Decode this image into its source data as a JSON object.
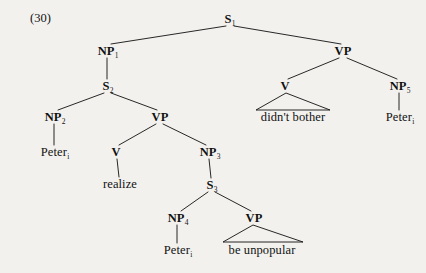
{
  "figure": {
    "example_number": "(30)",
    "type": "syntax-tree",
    "ink_color": "#111111",
    "background_color": "#f3f1ee"
  },
  "nodes": [
    {
      "id": "s1",
      "label": "S",
      "sub": "1",
      "x": 230,
      "y": 19,
      "kind": "nonterminal"
    },
    {
      "id": "np1",
      "label": "NP",
      "sub": "1",
      "x": 108,
      "y": 51,
      "kind": "nonterminal"
    },
    {
      "id": "vp_top",
      "label": "VP",
      "sub": "",
      "x": 343,
      "y": 51,
      "kind": "nonterminal"
    },
    {
      "id": "s2",
      "label": "S",
      "sub": "2",
      "x": 108,
      "y": 86,
      "kind": "nonterminal"
    },
    {
      "id": "v_top",
      "label": "V",
      "sub": "",
      "x": 285,
      "y": 86,
      "kind": "nonterminal"
    },
    {
      "id": "np5",
      "label": "NP",
      "sub": "5",
      "x": 400,
      "y": 86,
      "kind": "nonterminal"
    },
    {
      "id": "np2",
      "label": "NP",
      "sub": "2",
      "x": 55,
      "y": 117,
      "kind": "nonterminal"
    },
    {
      "id": "vp_mid",
      "label": "VP",
      "sub": "",
      "x": 160,
      "y": 117,
      "kind": "nonterminal"
    },
    {
      "id": "t_bother",
      "label": "didn't bother",
      "sub": "",
      "x": 293,
      "y": 117,
      "kind": "terminal"
    },
    {
      "id": "t_peter5",
      "label": "Peter",
      "sub": "i",
      "x": 400,
      "y": 117,
      "kind": "terminal"
    },
    {
      "id": "t_peter2",
      "label": "Peter",
      "sub": "i",
      "x": 55,
      "y": 152,
      "kind": "terminal"
    },
    {
      "id": "v_mid",
      "label": "V",
      "sub": "",
      "x": 116,
      "y": 152,
      "kind": "nonterminal"
    },
    {
      "id": "np3",
      "label": "NP",
      "sub": "3",
      "x": 210,
      "y": 152,
      "kind": "nonterminal"
    },
    {
      "id": "t_realize",
      "label": "realize",
      "sub": "",
      "x": 120,
      "y": 184,
      "kind": "terminal"
    },
    {
      "id": "s3",
      "label": "S",
      "sub": "3",
      "x": 212,
      "y": 185,
      "kind": "nonterminal"
    },
    {
      "id": "np4",
      "label": "NP",
      "sub": "4",
      "x": 178,
      "y": 218,
      "kind": "nonterminal"
    },
    {
      "id": "vp_low",
      "label": "VP",
      "sub": "",
      "x": 254,
      "y": 218,
      "kind": "nonterminal"
    },
    {
      "id": "t_peter4",
      "label": "Peter",
      "sub": "i",
      "x": 178,
      "y": 250,
      "kind": "terminal"
    },
    {
      "id": "t_unpop",
      "label": "be unpopular",
      "sub": "",
      "x": 262,
      "y": 250,
      "kind": "terminal"
    }
  ],
  "edges": [
    {
      "from": "s1",
      "to": "np1",
      "x1": 226,
      "y1": 26,
      "x2": 111,
      "y2": 44
    },
    {
      "from": "s1",
      "to": "vp_top",
      "x1": 234,
      "y1": 26,
      "x2": 341,
      "y2": 44
    },
    {
      "from": "np1",
      "to": "s2",
      "x1": 107,
      "y1": 58,
      "x2": 107,
      "y2": 79
    },
    {
      "from": "s2",
      "to": "np2",
      "x1": 104,
      "y1": 93,
      "x2": 58,
      "y2": 110
    },
    {
      "from": "s2",
      "to": "vp_mid",
      "x1": 111,
      "y1": 93,
      "x2": 157,
      "y2": 110
    },
    {
      "from": "np2",
      "to": "t_peter2",
      "x1": 54,
      "y1": 124,
      "x2": 54,
      "y2": 145
    },
    {
      "from": "vp_mid",
      "to": "v_mid",
      "x1": 156,
      "y1": 124,
      "x2": 119,
      "y2": 145
    },
    {
      "from": "vp_mid",
      "to": "np3",
      "x1": 163,
      "y1": 124,
      "x2": 206,
      "y2": 145
    },
    {
      "from": "v_mid",
      "to": "t_realize",
      "x1": 117,
      "y1": 159,
      "x2": 119,
      "y2": 177
    },
    {
      "from": "np3",
      "to": "s3",
      "x1": 209,
      "y1": 159,
      "x2": 211,
      "y2": 178
    },
    {
      "from": "s3",
      "to": "np4",
      "x1": 208,
      "y1": 192,
      "x2": 181,
      "y2": 211
    },
    {
      "from": "s3",
      "to": "vp_low",
      "x1": 215,
      "y1": 192,
      "x2": 251,
      "y2": 211
    },
    {
      "from": "np4",
      "to": "t_peter4",
      "x1": 177,
      "y1": 225,
      "x2": 177,
      "y2": 243
    },
    {
      "from": "vp_top",
      "to": "v_top",
      "x1": 339,
      "y1": 58,
      "x2": 288,
      "y2": 79
    },
    {
      "from": "vp_top",
      "to": "np5",
      "x1": 347,
      "y1": 58,
      "x2": 397,
      "y2": 79
    },
    {
      "from": "np5",
      "to": "t_peter5",
      "x1": 399,
      "y1": 93,
      "x2": 399,
      "y2": 110
    }
  ],
  "triangles": [
    {
      "id": "tri_bother",
      "apex_x": 286,
      "apex_y": 93,
      "left_x": 256,
      "right_x": 330,
      "base_y": 110
    },
    {
      "id": "tri_unpop",
      "apex_x": 253,
      "apex_y": 225,
      "left_x": 223,
      "right_x": 303,
      "base_y": 242
    }
  ]
}
